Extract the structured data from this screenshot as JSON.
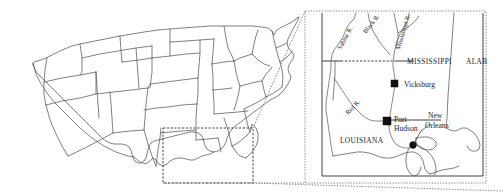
{
  "figure": {
    "background_color": "#ffffff",
    "line_color": "#4a4a4a",
    "label_color": "#1c1c1c",
    "marker_color": "#111111",
    "width": 503,
    "height": 196
  },
  "overview_map": {
    "name": "contiguous-united-states-outline",
    "description": "Outline map of the contiguous United States with state boundaries",
    "inset_selection_box": {
      "label": "inset region selection",
      "x": 163,
      "y": 128,
      "width": 90,
      "height": 55
    }
  },
  "inset_map": {
    "name": "lower-mississippi-valley-inset",
    "frame": {
      "x": 305,
      "y": 11,
      "width": 181,
      "height": 172
    },
    "states": [
      {
        "id": "mississippi",
        "label": "MISSISSIPPI",
        "x": 412,
        "y": 62
      },
      {
        "id": "alabama",
        "label": "ALAB",
        "x": 468,
        "y": 62
      },
      {
        "id": "louisiana",
        "label": "LOUISIANA",
        "x": 345,
        "y": 140
      }
    ],
    "rivers": [
      {
        "id": "sabine-river",
        "label": "Sabine R.",
        "x": 348,
        "y": 44,
        "rotation": -62
      },
      {
        "id": "black-river",
        "label": "Black R.",
        "x": 372,
        "y": 26,
        "rotation": -52
      },
      {
        "id": "mississippi-river",
        "label": "Mississippi R.",
        "x": 401,
        "y": 32,
        "rotation": -72
      },
      {
        "id": "red-river",
        "label": "Red R.",
        "x": 355,
        "y": 110,
        "rotation": -46
      }
    ],
    "cities": [
      {
        "id": "vicksburg",
        "label": "Vicksburg",
        "marker": "square",
        "marker_x": 395,
        "marker_y": 84,
        "label_x": 404,
        "label_y": 87
      },
      {
        "id": "port-hudson",
        "label": "Port Hudson",
        "marker": "square",
        "marker_x": 387,
        "marker_y": 123,
        "label_x": 395,
        "label_y": 123
      },
      {
        "id": "new-orleans",
        "label": "New Orleans",
        "marker": "circle",
        "marker_x": 413,
        "marker_y": 145,
        "label_x": 424,
        "label_y": 120
      }
    ]
  }
}
